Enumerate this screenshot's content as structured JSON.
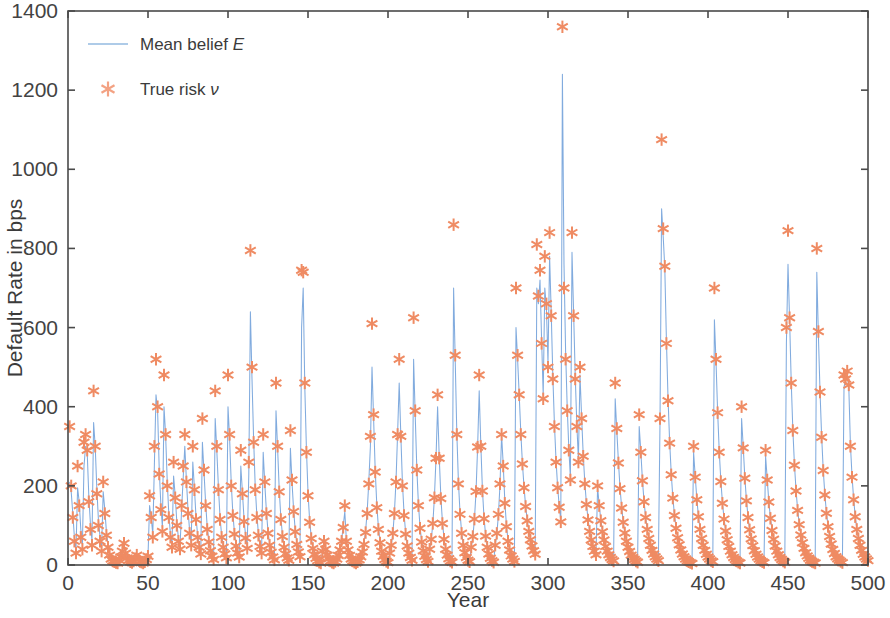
{
  "figure": {
    "width": 890,
    "height": 618,
    "background": "#ffffff"
  },
  "axes": {
    "x_title": "Year",
    "y_title": "Default Rate in bps",
    "x_ticks": [
      "0",
      "50",
      "100",
      "150",
      "200",
      "250",
      "300",
      "350",
      "400",
      "450",
      "500"
    ],
    "y_ticks": [
      "0",
      "200",
      "400",
      "600",
      "800",
      "1000",
      "1200",
      "1400"
    ],
    "box_color": "#4a4a4a"
  },
  "legend": {
    "items": [
      {
        "label_pre": "Mean belief ",
        "label_sym": "E",
        "type": "line",
        "color": "#aecbe8"
      },
      {
        "label_pre": "True risk ",
        "label_sym": "ν",
        "type": "marker",
        "color": "#f3a283"
      }
    ]
  },
  "chart_data": {
    "type": "line",
    "title": "",
    "subtitle": "",
    "xlabel": "Year",
    "ylabel": "Default Rate in bps",
    "xlim": [
      0,
      500
    ],
    "ylim": [
      0,
      1400
    ],
    "xticks": [
      0,
      50,
      100,
      150,
      200,
      250,
      300,
      350,
      400,
      450,
      500
    ],
    "yticks": [
      0,
      200,
      400,
      600,
      800,
      1000,
      1200,
      1400
    ],
    "grid": false,
    "legend_position": "upper-left",
    "series": [
      {
        "name": "Mean belief E",
        "plot_type": "line",
        "color": "#7aa6dc",
        "linewidth": 1.0,
        "marker": "none"
      },
      {
        "name": "True risk ν",
        "plot_type": "scatter",
        "color": "#ef8b63",
        "marker": "asterisk",
        "markersize": 13
      }
    ],
    "x": [
      1,
      2,
      3,
      4,
      5,
      6,
      7,
      8,
      9,
      10,
      11,
      12,
      13,
      14,
      15,
      16,
      17,
      18,
      19,
      20,
      21,
      22,
      23,
      24,
      25,
      26,
      27,
      28,
      29,
      30,
      31,
      32,
      33,
      34,
      35,
      36,
      37,
      38,
      39,
      40,
      41,
      42,
      43,
      44,
      45,
      46,
      47,
      48,
      49,
      50,
      51,
      52,
      53,
      54,
      55,
      56,
      57,
      58,
      59,
      60,
      61,
      62,
      63,
      64,
      65,
      66,
      67,
      68,
      69,
      70,
      71,
      72,
      73,
      74,
      75,
      76,
      77,
      78,
      79,
      80,
      81,
      82,
      83,
      84,
      85,
      86,
      87,
      88,
      89,
      90,
      91,
      92,
      93,
      94,
      95,
      96,
      97,
      98,
      99,
      100,
      101,
      102,
      103,
      104,
      105,
      106,
      107,
      108,
      109,
      110,
      111,
      112,
      113,
      114,
      115,
      116,
      117,
      118,
      119,
      120,
      121,
      122,
      123,
      124,
      125,
      126,
      127,
      128,
      129,
      130,
      131,
      132,
      133,
      134,
      135,
      136,
      137,
      138,
      139,
      140,
      141,
      142,
      143,
      144,
      145,
      146,
      147,
      148,
      149,
      150,
      151,
      152,
      153,
      154,
      155,
      156,
      157,
      158,
      159,
      160,
      161,
      162,
      163,
      164,
      165,
      166,
      167,
      168,
      169,
      170,
      171,
      172,
      173,
      174,
      175,
      176,
      177,
      178,
      179,
      180,
      181,
      182,
      183,
      184,
      185,
      186,
      187,
      188,
      189,
      190,
      191,
      192,
      193,
      194,
      195,
      196,
      197,
      198,
      199,
      200,
      201,
      202,
      203,
      204,
      205,
      206,
      207,
      208,
      209,
      210,
      211,
      212,
      213,
      214,
      215,
      216,
      217,
      218,
      219,
      220,
      221,
      222,
      223,
      224,
      225,
      226,
      227,
      228,
      229,
      230,
      231,
      232,
      233,
      234,
      235,
      236,
      237,
      238,
      239,
      240,
      241,
      242,
      243,
      244,
      245,
      246,
      247,
      248,
      249,
      250,
      251,
      252,
      253,
      254,
      255,
      256,
      257,
      258,
      259,
      260,
      261,
      262,
      263,
      264,
      265,
      266,
      267,
      268,
      269,
      270,
      271,
      272,
      273,
      274,
      275,
      276,
      277,
      278,
      279,
      280,
      281,
      282,
      283,
      284,
      285,
      286,
      287,
      288,
      289,
      290,
      291,
      292,
      293,
      294,
      295,
      296,
      297,
      298,
      299,
      300,
      301,
      302,
      303,
      304,
      305,
      306,
      307,
      308,
      309,
      310,
      311,
      312,
      313,
      314,
      315,
      316,
      317,
      318,
      319,
      320,
      321,
      322,
      323,
      324,
      325,
      326,
      327,
      328,
      329,
      330,
      331,
      332,
      333,
      334,
      335,
      336,
      337,
      338,
      339,
      340,
      341,
      342,
      343,
      344,
      345,
      346,
      347,
      348,
      349,
      350,
      351,
      352,
      353,
      354,
      355,
      356,
      357,
      358,
      359,
      360,
      361,
      362,
      363,
      364,
      365,
      366,
      367,
      368,
      369,
      370,
      371,
      372,
      373,
      374,
      375,
      376,
      377,
      378,
      379,
      380,
      381,
      382,
      383,
      384,
      385,
      386,
      387,
      388,
      389,
      390,
      391,
      392,
      393,
      394,
      395,
      396,
      397,
      398,
      399,
      400,
      401,
      402,
      403,
      404,
      405,
      406,
      407,
      408,
      409,
      410,
      411,
      412,
      413,
      414,
      415,
      416,
      417,
      418,
      419,
      420,
      421,
      422,
      423,
      424,
      425,
      426,
      427,
      428,
      429,
      430,
      431,
      432,
      433,
      434,
      435,
      436,
      437,
      438,
      439,
      440,
      441,
      442,
      443,
      444,
      445,
      446,
      447,
      448,
      449,
      450,
      451,
      452,
      453,
      454,
      455,
      456,
      457,
      458,
      459,
      460,
      461,
      462,
      463,
      464,
      465,
      466,
      467,
      468,
      469,
      470,
      471,
      472,
      473,
      474,
      475,
      476,
      477,
      478,
      479,
      480,
      481,
      482,
      483,
      484,
      485,
      486,
      487,
      488,
      489,
      490,
      491,
      492,
      493,
      494,
      495,
      496,
      497,
      498,
      499,
      500
    ],
    "true_risk": [
      350,
      200,
      120,
      60,
      30,
      250,
      150,
      70,
      40,
      310,
      330,
      290,
      160,
      90,
      50,
      440,
      300,
      180,
      100,
      60,
      35,
      210,
      130,
      75,
      45,
      25,
      15,
      10,
      8,
      6,
      5,
      12,
      20,
      35,
      55,
      30,
      18,
      12,
      8,
      6,
      10,
      16,
      25,
      14,
      9,
      7,
      5,
      8,
      14,
      22,
      175,
      120,
      70,
      300,
      520,
      400,
      230,
      140,
      85,
      480,
      330,
      200,
      120,
      70,
      45,
      260,
      170,
      100,
      60,
      40,
      150,
      250,
      330,
      210,
      130,
      80,
      50,
      300,
      190,
      115,
      70,
      45,
      28,
      370,
      240,
      150,
      90,
      58,
      36,
      22,
      14,
      440,
      300,
      190,
      115,
      70,
      45,
      28,
      18,
      480,
      330,
      200,
      125,
      78,
      48,
      30,
      20,
      290,
      180,
      110,
      68,
      42,
      260,
      795,
      500,
      310,
      190,
      120,
      75,
      47,
      30,
      330,
      210,
      130,
      80,
      50,
      32,
      20,
      13,
      460,
      300,
      185,
      115,
      72,
      45,
      28,
      18,
      12,
      340,
      215,
      135,
      84,
      52,
      33,
      21,
      745,
      740,
      460,
      285,
      175,
      108,
      67,
      42,
      26,
      17,
      11,
      7,
      5,
      35,
      60,
      40,
      25,
      16,
      10,
      7,
      5,
      9,
      15,
      24,
      38,
      60,
      95,
      150,
      60,
      38,
      24,
      15,
      10,
      7,
      5,
      8,
      13,
      21,
      33,
      52,
      82,
      130,
      205,
      325,
      610,
      380,
      235,
      145,
      90,
      56,
      35,
      22,
      14,
      9,
      6,
      30,
      50,
      80,
      130,
      210,
      330,
      520,
      325,
      200,
      125,
      78,
      48,
      30,
      19,
      12,
      625,
      390,
      240,
      150,
      93,
      58,
      36,
      22,
      14,
      9,
      40,
      65,
      105,
      170,
      270,
      430,
      270,
      168,
      105,
      65,
      40,
      25,
      16,
      10,
      7,
      860,
      530,
      330,
      205,
      128,
      80,
      50,
      31,
      19,
      12,
      8,
      45,
      72,
      116,
      186,
      298,
      480,
      300,
      187,
      117,
      73,
      45,
      28,
      17,
      11,
      7,
      50,
      80,
      128,
      205,
      330,
      250,
      156,
      97,
      60,
      38,
      23,
      15,
      9,
      700,
      530,
      430,
      330,
      255,
      195,
      148,
      112,
      85,
      64,
      48,
      36,
      27,
      810,
      680,
      745,
      560,
      420,
      780,
      660,
      500,
      840,
      630,
      470,
      350,
      260,
      195,
      146,
      109,
      1360,
      700,
      520,
      390,
      290,
      215,
      840,
      630,
      470,
      350,
      260,
      500,
      370,
      275,
      205,
      153,
      114,
      85,
      63,
      47,
      35,
      26,
      200,
      150,
      112,
      84,
      63,
      47,
      35,
      26,
      19,
      14,
      10,
      460,
      345,
      258,
      193,
      144,
      108,
      81,
      60,
      45,
      34,
      25,
      19,
      14,
      10,
      7,
      380,
      285,
      213,
      160,
      120,
      90,
      67,
      50,
      37,
      28,
      21,
      15,
      11,
      370,
      1075,
      850,
      755,
      560,
      415,
      308,
      228,
      169,
      125,
      93,
      69,
      51,
      38,
      28,
      21,
      15,
      11,
      8,
      6,
      4,
      300,
      222,
      165,
      122,
      90,
      67,
      50,
      37,
      27,
      20,
      15,
      11,
      8,
      700,
      520,
      385,
      285,
      211,
      156,
      116,
      86,
      64,
      47,
      35,
      26,
      19,
      14,
      10,
      7,
      5,
      400,
      296,
      219,
      162,
      120,
      89,
      66,
      49,
      36,
      27,
      20,
      15,
      11,
      8,
      6,
      290,
      215,
      159,
      118,
      87,
      65,
      48,
      35,
      26,
      19,
      14,
      10,
      7,
      600,
      845,
      625,
      460,
      340,
      252,
      187,
      138,
      102,
      76,
      56,
      42,
      31,
      23,
      17,
      12,
      9,
      7,
      5,
      800,
      590,
      437,
      323,
      239,
      177,
      131,
      97,
      72,
      53,
      39,
      29,
      21,
      16,
      12,
      9,
      6,
      480,
      470,
      490,
      455,
      300,
      222,
      165,
      122,
      90,
      67,
      50,
      37,
      27,
      20,
      15,
      11,
      8,
      6,
      760,
      750,
      560,
      415,
      307,
      227,
      168,
      124,
      92,
      68,
      50,
      37,
      28,
      20,
      15,
      11,
      8,
      6,
      4,
      380,
      281,
      208,
      154,
      114,
      84,
      62,
      46,
      34,
      25,
      19,
      14,
      10,
      7,
      5,
      4,
      3,
      5,
      8,
      12,
      18,
      27,
      40,
      60,
      90,
      135,
      60,
      40,
      26,
      17,
      11,
      7,
      5,
      8,
      12,
      18,
      27,
      15,
      10,
      7,
      5,
      8,
      13,
      20
    ],
    "mean_belief": [
      210,
      185,
      130,
      70,
      38,
      195,
      160,
      90,
      52,
      250,
      300,
      285,
      175,
      105,
      62,
      360,
      300,
      195,
      115,
      72,
      42,
      185,
      140,
      85,
      52,
      30,
      18,
      12,
      9,
      7,
      6,
      13,
      22,
      36,
      54,
      33,
      20,
      13,
      9,
      7,
      11,
      17,
      26,
      15,
      10,
      8,
      6,
      9,
      15,
      23,
      150,
      120,
      78,
      255,
      430,
      390,
      245,
      155,
      95,
      400,
      330,
      215,
      130,
      78,
      50,
      225,
      175,
      110,
      68,
      45,
      140,
      220,
      300,
      215,
      140,
      88,
      55,
      260,
      195,
      122,
      76,
      50,
      31,
      310,
      235,
      158,
      97,
      62,
      39,
      24,
      15,
      370,
      290,
      198,
      122,
      76,
      49,
      30,
      19,
      400,
      320,
      210,
      132,
      83,
      52,
      33,
      22,
      250,
      185,
      118,
      73,
      46,
      230,
      640,
      470,
      320,
      200,
      128,
      80,
      50,
      32,
      285,
      205,
      136,
      85,
      54,
      34,
      22,
      14,
      390,
      295,
      192,
      122,
      77,
      48,
      30,
      19,
      13,
      295,
      210,
      140,
      89,
      56,
      35,
      22,
      600,
      700,
      450,
      295,
      184,
      114,
      71,
      45,
      28,
      18,
      12,
      8,
      6,
      32,
      55,
      42,
      27,
      17,
      11,
      8,
      6,
      10,
      16,
      25,
      40,
      62,
      98,
      135,
      62,
      40,
      26,
      16,
      11,
      8,
      6,
      9,
      14,
      22,
      35,
      55,
      86,
      136,
      210,
      300,
      500,
      370,
      240,
      152,
      95,
      59,
      37,
      23,
      15,
      10,
      7,
      28,
      48,
      78,
      132,
      212,
      332,
      460,
      330,
      210,
      132,
      82,
      51,
      32,
      20,
      13,
      520,
      380,
      245,
      155,
      97,
      61,
      38,
      24,
      15,
      10,
      38,
      63,
      103,
      170,
      270,
      400,
      275,
      175,
      110,
      68,
      42,
      26,
      17,
      11,
      8,
      700,
      520,
      335,
      212,
      133,
      83,
      52,
      33,
      20,
      13,
      9,
      43,
      70,
      114,
      184,
      296,
      440,
      305,
      192,
      121,
      76,
      47,
      29,
      18,
      12,
      8,
      48,
      78,
      126,
      203,
      328,
      255,
      162,
      101,
      63,
      40,
      24,
      16,
      10,
      600,
      520,
      430,
      335,
      258,
      198,
      150,
      114,
      87,
      65,
      49,
      37,
      28,
      700,
      660,
      720,
      570,
      430,
      700,
      650,
      510,
      780,
      640,
      480,
      358,
      266,
      199,
      149,
      112,
      1240,
      760,
      540,
      400,
      296,
      220,
      790,
      640,
      480,
      357,
      266,
      480,
      375,
      280,
      209,
      156,
      116,
      87,
      64,
      48,
      36,
      27,
      195,
      152,
      114,
      86,
      64,
      48,
      36,
      27,
      20,
      14,
      10,
      420,
      340,
      262,
      196,
      147,
      110,
      83,
      61,
      46,
      35,
      26,
      19,
      14,
      10,
      7,
      350,
      288,
      216,
      162,
      122,
      91,
      68,
      51,
      38,
      28,
      21,
      15,
      11,
      360,
      900,
      830,
      750,
      570,
      424,
      314,
      233,
      172,
      128,
      95,
      70,
      52,
      39,
      29,
      21,
      15,
      11,
      8,
      6,
      4,
      285,
      225,
      168,
      124,
      92,
      68,
      51,
      38,
      28,
      20,
      15,
      11,
      8,
      620,
      515,
      390,
      290,
      215,
      159,
      118,
      88,
      65,
      48,
      36,
      26,
      19,
      14,
      10,
      7,
      5,
      370,
      300,
      222,
      165,
      122,
      90,
      67,
      50,
      37,
      27,
      20,
      15,
      11,
      8,
      6,
      275,
      218,
      161,
      120,
      89,
      66,
      49,
      36,
      26,
      19,
      14,
      10,
      7,
      560,
      760,
      620,
      465,
      345,
      256,
      190,
      141,
      104,
      77,
      57,
      42,
      31,
      23,
      17,
      12,
      9,
      7,
      5,
      740,
      580,
      440,
      327,
      242,
      180,
      133,
      99,
      73,
      54,
      40,
      29,
      22,
      16,
      12,
      9,
      6,
      450,
      465,
      480,
      450,
      305,
      226,
      168,
      124,
      92,
      68,
      51,
      37,
      28,
      20,
      15,
      11,
      8,
      6,
      700,
      740,
      565,
      420,
      311,
      230,
      171,
      126,
      94,
      69,
      51,
      38,
      28,
      21,
      15,
      11,
      8,
      6,
      4,
      350,
      278,
      211,
      156,
      116,
      85,
      63,
      47,
      35,
      26,
      19,
      14,
      10,
      7,
      5,
      4,
      3,
      5,
      8,
      12,
      18,
      27,
      40,
      60,
      90,
      120,
      62,
      41,
      26,
      17,
      11,
      8,
      5,
      8,
      12,
      18,
      27,
      15,
      10,
      7,
      5,
      8,
      13,
      20
    ]
  }
}
